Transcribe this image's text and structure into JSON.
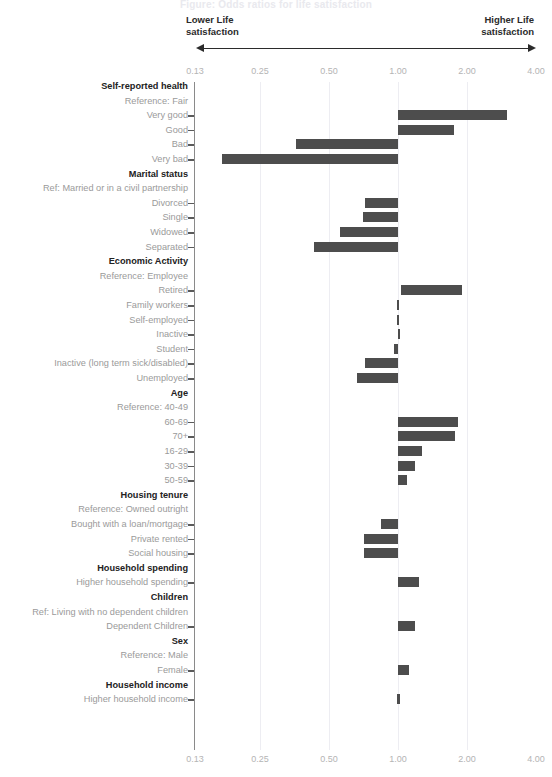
{
  "title_strip": "Figure: Odds ratios for life satisfaction",
  "annotations": {
    "left_arrow_label": "Lower Life\nsatisfaction",
    "right_arrow_label": "Higher Life\nsatisfaction",
    "arrow_icon_left": "arrow-left-icon",
    "arrow_icon_right": "arrow-right-icon"
  },
  "colors": {
    "bar": "#4d4d4d",
    "gridline": "#ededf2",
    "axis": "#8a8a8a",
    "tick_text": "#b4b4b4",
    "group_text": "#222222",
    "row_text": "#9a9a9a"
  },
  "chart_data": {
    "type": "bar",
    "orientation": "horizontal",
    "title": "Odds ratios for life satisfaction",
    "subtitle": "",
    "xlabel": "",
    "ylabel": "",
    "xscale": "log",
    "xlim": [
      0.13,
      4.0
    ],
    "xticks": [
      0.13,
      0.25,
      0.5,
      1.0,
      2.0,
      4.0
    ],
    "xticklabels": [
      "0.13",
      "0.25",
      "0.50",
      "1.00",
      "2.00",
      "4.00"
    ],
    "grid": "vertical-only",
    "legend": "none",
    "reference_line": 1.0,
    "note": "Each bar is a confidence interval for the odds ratio relative to the group reference category.",
    "groups": [
      {
        "group": "Self-reported health",
        "reference": "Reference: Fair",
        "rows": [
          {
            "label": "Very good",
            "low": 1.0,
            "high": 3.0
          },
          {
            "label": "Good",
            "low": 1.0,
            "high": 1.75
          },
          {
            "label": "Bad",
            "low": 0.36,
            "high": 1.0
          },
          {
            "label": "Very bad",
            "low": 0.17,
            "high": 1.0
          }
        ]
      },
      {
        "group": "Marital status",
        "reference": "Ref: Married or in a civil partnership",
        "rows": [
          {
            "label": "Divorced",
            "low": 0.72,
            "high": 1.0
          },
          {
            "label": "Single",
            "low": 0.7,
            "high": 1.0
          },
          {
            "label": "Widowed",
            "low": 0.56,
            "high": 1.0
          },
          {
            "label": "Separated",
            "low": 0.43,
            "high": 1.0
          }
        ]
      },
      {
        "group": "Economic Activity",
        "reference": "Reference: Employee",
        "rows": [
          {
            "label": "Retired",
            "low": 1.03,
            "high": 1.9
          },
          {
            "label": "Family workers",
            "low": 0.99,
            "high": 1.01
          },
          {
            "label": "Self-employed",
            "low": 0.99,
            "high": 1.01
          },
          {
            "label": "Inactive",
            "low": 1.0,
            "high": 1.0
          },
          {
            "label": "Student",
            "low": 0.96,
            "high": 1.0
          },
          {
            "label": "Inactive (long term sick/disabled)",
            "low": 0.72,
            "high": 1.0
          },
          {
            "label": "Unemployed",
            "low": 0.66,
            "high": 1.0
          }
        ]
      },
      {
        "group": "Age",
        "reference": "Reference: 40-49",
        "rows": [
          {
            "label": "60-69",
            "low": 1.0,
            "high": 1.82
          },
          {
            "label": "70+",
            "low": 1.0,
            "high": 1.78
          },
          {
            "label": "16-29",
            "low": 1.0,
            "high": 1.27
          },
          {
            "label": "30-39",
            "low": 1.0,
            "high": 1.19
          },
          {
            "label": "50-59",
            "low": 1.0,
            "high": 1.09
          }
        ]
      },
      {
        "group": "Housing tenure",
        "reference": "Reference: Owned outright",
        "rows": [
          {
            "label": "Bought with a loan/mortgage",
            "low": 0.84,
            "high": 1.0
          },
          {
            "label": "Private rented",
            "low": 0.71,
            "high": 1.0
          },
          {
            "label": "Social housing",
            "low": 0.71,
            "high": 1.0
          }
        ]
      },
      {
        "group": "Household spending",
        "reference": "",
        "rows": [
          {
            "label": "Higher household spending",
            "low": 1.0,
            "high": 1.23
          }
        ]
      },
      {
        "group": "Children",
        "reference": "Ref: Living with no dependent children",
        "rows": [
          {
            "label": "Dependent Children",
            "low": 1.0,
            "high": 1.18
          }
        ]
      },
      {
        "group": "Sex",
        "reference": "Reference: Male",
        "rows": [
          {
            "label": "Female",
            "low": 1.0,
            "high": 1.12
          }
        ]
      },
      {
        "group": "Household income",
        "reference": "",
        "rows": [
          {
            "label": "Higher household income",
            "low": 0.99,
            "high": 1.02
          }
        ]
      }
    ]
  }
}
